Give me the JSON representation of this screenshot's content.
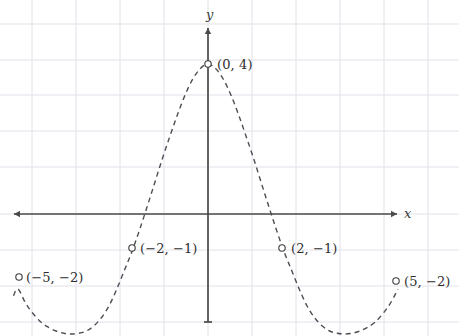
{
  "figure": {
    "width": 459,
    "height": 336,
    "background": "#ffffff"
  },
  "axes": {
    "x_label": "x",
    "y_label": "y",
    "axis_color": "#4a4a4a",
    "grid_color": "#e2e2ea",
    "origin_px": [
      208,
      214
    ],
    "unit_px_x": 38,
    "unit_px_y": 37.5,
    "x_axis_from_px": [
      14,
      214
    ],
    "x_axis_to_px": [
      397,
      214
    ],
    "y_axis_from_px": [
      208,
      322
    ],
    "y_axis_to_px": [
      208,
      28
    ],
    "grid_x_px": [
      32,
      76,
      120,
      164,
      208,
      252,
      296,
      340,
      384,
      428
    ],
    "grid_y_px": [
      24,
      60,
      95,
      131,
      167,
      214,
      250,
      286,
      322
    ]
  },
  "curve": {
    "style": "dashed",
    "color": "#4d4d55",
    "stroke_width": 1.4,
    "dash_pattern": "5,4"
  },
  "markers": {
    "style": "open-circle",
    "radius": 3.2,
    "stroke": "#3a3a3a",
    "fill": "#ffffff"
  },
  "chart_data": {
    "type": "line",
    "title": "",
    "xlabel": "x",
    "ylabel": "y",
    "grid": true,
    "legend": null,
    "xlim": [
      -5.1,
      5.0
    ],
    "ylim": [
      -2.9,
      2.9
    ],
    "curve_description": "Dashed even function with a central peak at (0,4), two minima near x = -3.5 and x = 3.5, passing through the labeled points.",
    "labeled_points": [
      {
        "label": "(-5,-2)",
        "display": "(−5, −2)",
        "x": -5,
        "y": -2,
        "px": [
          19,
          277
        ],
        "label_px": [
          26,
          270
        ],
        "label_align": "left"
      },
      {
        "label": "(-2,-1)",
        "display": "(−2, −1)",
        "x": -2,
        "y": -1,
        "px": [
          132,
          248
        ],
        "label_px": [
          140,
          241
        ],
        "label_align": "left"
      },
      {
        "label": "(0,4)",
        "display": "(0, 4)",
        "x": 0,
        "y": 4,
        "px": [
          208,
          64
        ],
        "label_px": [
          217,
          57
        ],
        "label_align": "left"
      },
      {
        "label": "(2,-1)",
        "display": "(2, −1)",
        "x": 2,
        "y": -1,
        "px": [
          282,
          248
        ],
        "label_px": [
          291,
          241
        ],
        "label_align": "left"
      },
      {
        "label": "(5,-2)",
        "display": "(5, −2)",
        "x": 5,
        "y": -2,
        "px": [
          396,
          281
        ],
        "label_px": [
          404,
          274
        ],
        "label_align": "left"
      }
    ],
    "curve_points": [
      [
        -5.12,
        -2.18
      ],
      [
        -5.0,
        -2.0
      ],
      [
        -4.8,
        -2.38
      ],
      [
        -4.6,
        -2.66
      ],
      [
        -4.4,
        -2.88
      ],
      [
        -4.2,
        -3.02
      ],
      [
        -4.0,
        -3.12
      ],
      [
        -3.8,
        -3.18
      ],
      [
        -3.6,
        -3.2
      ],
      [
        -3.4,
        -3.18
      ],
      [
        -3.2,
        -3.12
      ],
      [
        -3.0,
        -2.98
      ],
      [
        -2.8,
        -2.76
      ],
      [
        -2.6,
        -2.44
      ],
      [
        -2.4,
        -2.0
      ],
      [
        -2.2,
        -1.5
      ],
      [
        -2.0,
        -1.0
      ],
      [
        -1.8,
        -0.42
      ],
      [
        -1.6,
        0.2
      ],
      [
        -1.4,
        0.84
      ],
      [
        -1.2,
        1.48
      ],
      [
        -1.0,
        2.08
      ],
      [
        -0.8,
        2.66
      ],
      [
        -0.6,
        3.18
      ],
      [
        -0.4,
        3.6
      ],
      [
        -0.2,
        3.88
      ],
      [
        0.0,
        4.0
      ],
      [
        0.2,
        3.88
      ],
      [
        0.4,
        3.6
      ],
      [
        0.6,
        3.18
      ],
      [
        0.8,
        2.66
      ],
      [
        1.0,
        2.08
      ],
      [
        1.2,
        1.48
      ],
      [
        1.4,
        0.84
      ],
      [
        1.6,
        0.2
      ],
      [
        1.8,
        -0.42
      ],
      [
        2.0,
        -1.0
      ],
      [
        2.2,
        -1.5
      ],
      [
        2.4,
        -2.0
      ],
      [
        2.6,
        -2.44
      ],
      [
        2.8,
        -2.76
      ],
      [
        3.0,
        -2.98
      ],
      [
        3.2,
        -3.12
      ],
      [
        3.4,
        -3.18
      ],
      [
        3.6,
        -3.2
      ],
      [
        3.8,
        -3.18
      ],
      [
        4.0,
        -3.12
      ],
      [
        4.2,
        -3.02
      ],
      [
        4.4,
        -2.88
      ],
      [
        4.6,
        -2.66
      ],
      [
        4.8,
        -2.38
      ],
      [
        5.0,
        -2.0
      ]
    ]
  }
}
